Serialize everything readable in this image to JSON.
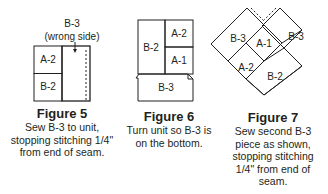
{
  "figure5": {
    "top_label": "B-3",
    "top_sublabel": "(wrong side)",
    "pieces": [
      "A-2",
      "B-2"
    ],
    "title": "Figure 5",
    "caption_lines": [
      "Sew B-3 to unit,",
      "stopping stitching 1/4\"",
      "from end of seam."
    ]
  },
  "figure6": {
    "pieces": [
      "B-2",
      "A-2",
      "A-1",
      "B-3"
    ],
    "title": "Figure 6",
    "caption_lines": [
      "Turn unit so B-3 is",
      "on the bottom."
    ]
  },
  "figure7": {
    "pieces": [
      "B-3",
      "B-3",
      "A-1",
      "A-2",
      "B-2"
    ],
    "title": "Figure 7",
    "caption_lines": [
      "Sew second B-3",
      "piece as shown,",
      "stopping stitching",
      "1/4\" from end of",
      "seam."
    ]
  },
  "colors": {
    "ink": "#231f20",
    "background": "#ffffff"
  }
}
